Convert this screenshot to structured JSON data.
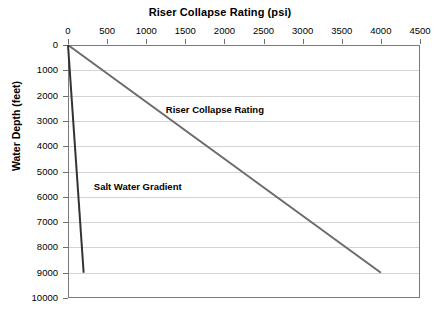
{
  "chart_data": {
    "type": "line",
    "title": "Riser Collapse Rating (psi)",
    "xlabel": "Riser Collapse Rating (psi)",
    "ylabel": "Water Depth (feet)",
    "xlim": [
      0,
      4500
    ],
    "ylim": [
      0,
      10000
    ],
    "y_inverted": true,
    "grid": "horizontal",
    "legend_position": "inline-annotations",
    "xticks": [
      0,
      500,
      1000,
      1500,
      2000,
      2500,
      3000,
      3500,
      4000,
      4500
    ],
    "xtick_labels": [
      "0",
      "500",
      "1000",
      "1500",
      "2000",
      "2500",
      "3000",
      "3500",
      "4000",
      "4500"
    ],
    "yticks": [
      0,
      1000,
      2000,
      3000,
      4000,
      5000,
      6000,
      7000,
      8000,
      9000,
      10000
    ],
    "ytick_labels": [
      "0",
      "1000",
      "2000",
      "3000",
      "4000",
      "5000",
      "6000",
      "7000",
      "8000",
      "9000",
      "10000"
    ],
    "series": [
      {
        "name": "Riser Collapse Rating",
        "color": "#6b6b6b",
        "width": 2,
        "x": [
          0,
          4000
        ],
        "y": [
          0,
          9000
        ],
        "annotation": "Riser Collapse Rating",
        "annotation_x": 1250,
        "annotation_y": 2550
      },
      {
        "name": "Salt Water Gradient",
        "color": "#333333",
        "width": 2,
        "x": [
          0,
          200
        ],
        "y": [
          0,
          9000
        ],
        "annotation": "Salt Water Gradient",
        "annotation_x": 330,
        "annotation_y": 5600
      }
    ]
  }
}
